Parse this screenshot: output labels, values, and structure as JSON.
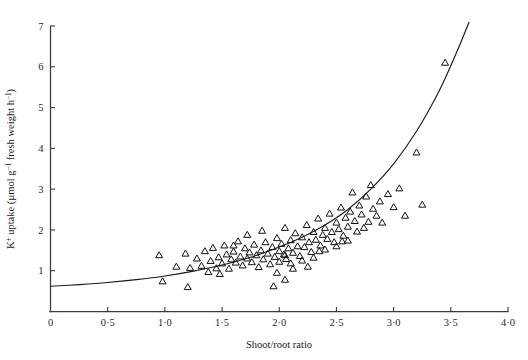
{
  "figure": {
    "background": "#ffffff",
    "ink_color": "#1a1a1a",
    "curve_color": "#1a1a1a",
    "marker_color": "#111111"
  },
  "chart_data": {
    "type": "scatter",
    "title": "",
    "xlabel": "Shoot/root ratio",
    "ylabel": "K+ uptake (µmol g-1 fresh weight h-1)",
    "ylabel_parts": {
      "symbol": "K",
      "symbol_sup": "+",
      "word": " uptake (",
      "unit_mu": "µmol g",
      "unit_sup1": "−1",
      "unit_mid": " fresh weight h",
      "unit_sup2": "−1",
      "close": ")"
    },
    "grid": false,
    "legend": "none",
    "xlim": [
      0,
      4.0
    ],
    "ylim": [
      0,
      7.0
    ],
    "xticks": [
      0,
      0.5,
      1.0,
      1.5,
      2.0,
      2.5,
      3.0,
      3.5,
      4.0
    ],
    "xticklabels": [
      "0",
      "0·5",
      "1·0",
      "1·5",
      "2·0",
      "2·5",
      "3·0",
      "3·5",
      "4·0"
    ],
    "yticks": [
      1,
      2,
      3,
      4,
      5,
      6,
      7
    ],
    "yticklabels": [
      "1",
      "2",
      "3",
      "4",
      "5",
      "6",
      "7"
    ],
    "marker_style": "open-triangle-up",
    "marker_size_px": 7,
    "points": [
      [
        0.95,
        1.38
      ],
      [
        0.98,
        0.74
      ],
      [
        1.1,
        1.1
      ],
      [
        1.18,
        1.42
      ],
      [
        1.2,
        0.6
      ],
      [
        1.22,
        1.07
      ],
      [
        1.28,
        1.3
      ],
      [
        1.32,
        1.12
      ],
      [
        1.35,
        1.48
      ],
      [
        1.38,
        0.97
      ],
      [
        1.4,
        1.24
      ],
      [
        1.42,
        1.56
      ],
      [
        1.45,
        1.06
      ],
      [
        1.47,
        1.33
      ],
      [
        1.5,
        1.18
      ],
      [
        1.52,
        1.62
      ],
      [
        1.54,
        1.4
      ],
      [
        1.56,
        1.05
      ],
      [
        1.58,
        1.28
      ],
      [
        1.6,
        1.47
      ],
      [
        1.62,
        1.2
      ],
      [
        1.64,
        1.72
      ],
      [
        1.66,
        1.35
      ],
      [
        1.68,
        1.13
      ],
      [
        1.7,
        1.55
      ],
      [
        1.72,
        1.3
      ],
      [
        1.74,
        1.45
      ],
      [
        1.76,
        1.21
      ],
      [
        1.78,
        1.64
      ],
      [
        1.8,
        1.38
      ],
      [
        1.82,
        1.09
      ],
      [
        1.84,
        1.5
      ],
      [
        1.86,
        1.28
      ],
      [
        1.88,
        1.7
      ],
      [
        1.9,
        1.42
      ],
      [
        1.92,
        1.16
      ],
      [
        1.94,
        1.58
      ],
      [
        1.95,
        0.62
      ],
      [
        1.96,
        1.34
      ],
      [
        1.98,
        1.8
      ],
      [
        1.98,
        0.95
      ],
      [
        2.0,
        1.48
      ],
      [
        2.0,
        1.22
      ],
      [
        2.02,
        1.66
      ],
      [
        2.04,
        1.4
      ],
      [
        2.05,
        2.05
      ],
      [
        2.06,
        1.29
      ],
      [
        2.08,
        1.55
      ],
      [
        2.1,
        1.75
      ],
      [
        2.1,
        1.18
      ],
      [
        2.12,
        1.44
      ],
      [
        2.14,
        1.92
      ],
      [
        2.16,
        1.6
      ],
      [
        2.18,
        1.36
      ],
      [
        2.2,
        1.82
      ],
      [
        2.2,
        1.25
      ],
      [
        2.22,
        1.58
      ],
      [
        2.24,
        2.12
      ],
      [
        2.26,
        1.7
      ],
      [
        2.28,
        1.46
      ],
      [
        2.3,
        1.95
      ],
      [
        2.3,
        1.32
      ],
      [
        2.32,
        1.76
      ],
      [
        2.34,
        2.28
      ],
      [
        2.36,
        1.62
      ],
      [
        2.38,
        1.88
      ],
      [
        2.4,
        2.05
      ],
      [
        2.4,
        1.52
      ],
      [
        2.42,
        1.78
      ],
      [
        2.44,
        2.4
      ],
      [
        2.46,
        1.95
      ],
      [
        2.48,
        1.7
      ],
      [
        2.5,
        2.18
      ],
      [
        2.5,
        1.6
      ],
      [
        2.52,
        2.02
      ],
      [
        2.54,
        2.55
      ],
      [
        2.56,
        1.86
      ],
      [
        2.58,
        2.3
      ],
      [
        2.6,
        2.08
      ],
      [
        2.6,
        1.74
      ],
      [
        2.62,
        2.45
      ],
      [
        2.64,
        2.92
      ],
      [
        2.66,
        2.22
      ],
      [
        2.68,
        1.96
      ],
      [
        2.7,
        2.6
      ],
      [
        2.72,
        2.38
      ],
      [
        2.74,
        2.05
      ],
      [
        2.76,
        2.82
      ],
      [
        2.78,
        2.2
      ],
      [
        2.8,
        3.1
      ],
      [
        2.82,
        2.52
      ],
      [
        2.85,
        2.35
      ],
      [
        2.88,
        2.7
      ],
      [
        2.9,
        2.18
      ],
      [
        2.95,
        2.88
      ],
      [
        3.0,
        2.56
      ],
      [
        3.05,
        3.02
      ],
      [
        3.1,
        2.35
      ],
      [
        3.2,
        3.9
      ],
      [
        3.25,
        2.62
      ],
      [
        3.45,
        6.1
      ],
      [
        1.6,
        1.62
      ],
      [
        1.72,
        1.88
      ],
      [
        1.85,
        1.98
      ],
      [
        2.05,
        1.38
      ],
      [
        2.12,
        1.05
      ],
      [
        2.25,
        1.1
      ],
      [
        2.35,
        1.48
      ],
      [
        2.55,
        1.72
      ],
      [
        2.05,
        0.78
      ],
      [
        1.48,
        0.92
      ]
    ],
    "fit_curve": {
      "description": "exponential fitted trend line",
      "points": [
        [
          0.0,
          0.62
        ],
        [
          0.25,
          0.66
        ],
        [
          0.5,
          0.71
        ],
        [
          0.75,
          0.78
        ],
        [
          1.0,
          0.87
        ],
        [
          1.25,
          0.99
        ],
        [
          1.5,
          1.14
        ],
        [
          1.75,
          1.33
        ],
        [
          2.0,
          1.58
        ],
        [
          2.2,
          1.82
        ],
        [
          2.4,
          2.12
        ],
        [
          2.6,
          2.5
        ],
        [
          2.8,
          3.0
        ],
        [
          3.0,
          3.62
        ],
        [
          3.2,
          4.42
        ],
        [
          3.4,
          5.42
        ],
        [
          3.55,
          6.35
        ],
        [
          3.66,
          7.1
        ]
      ]
    }
  }
}
